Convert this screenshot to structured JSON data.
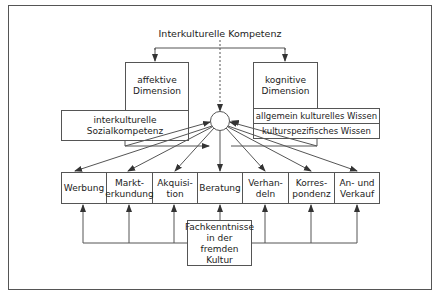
{
  "diagram": {
    "title": "Interkulturelle Kompetenz",
    "affective": {
      "dimension": "affektive Dimension",
      "line1": "affektive",
      "line2": "Dimension",
      "component_line1": "interkulturelle",
      "component_line2": "Sozialkompetenz"
    },
    "cognitive": {
      "line1": "kognitive",
      "line2": "Dimension",
      "components": [
        "allgemein kulturelles Wissen",
        "kulturspezifisches Wissen"
      ]
    },
    "activities": [
      {
        "line1": "Werbung",
        "line2": ""
      },
      {
        "line1": "Markt-",
        "line2": "erkundung"
      },
      {
        "line1": "Akquisi-",
        "line2": "tion"
      },
      {
        "line1": "Beratung",
        "line2": ""
      },
      {
        "line1": "Verhan-",
        "line2": "deln"
      },
      {
        "line1": "Korres-",
        "line2": "pondenz"
      },
      {
        "line1": "An- und",
        "line2": "Verkauf"
      }
    ],
    "expertise": {
      "line1": "Fachkenntnisse",
      "line2": "in der fremden",
      "line3": "Kultur"
    },
    "colors": {
      "stroke": "#555555",
      "background": "#ffffff",
      "text": "#222222"
    }
  }
}
